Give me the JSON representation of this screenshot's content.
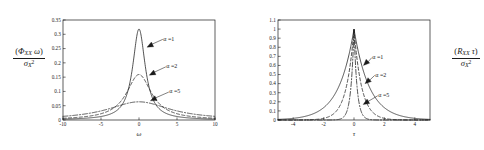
{
  "figure": {
    "background_color": "#ffffff",
    "line_color": "#1a1a1a"
  },
  "panels": [
    {
      "id": "left",
      "y_axis_label": {
        "numerator_prefix": "(",
        "numerator_symbol": "Φ",
        "numerator_subscript": "XX",
        "numerator_variable": "ω",
        "numerator_suffix": ")",
        "denominator_symbol": "σ",
        "denominator_subscript": "X",
        "denominator_superscript": "2"
      },
      "x_axis_label": "ω",
      "annotations": [
        {
          "label": "α =1",
          "tip_x": 1.05,
          "tip_y": 0.255
        },
        {
          "label": "α =2",
          "tip_x": 1.35,
          "tip_y": 0.157
        },
        {
          "label": "α =5",
          "tip_x": 1.5,
          "tip_y": 0.067
        }
      ]
    },
    {
      "id": "right",
      "y_axis_label": {
        "numerator_prefix": "(",
        "numerator_symbol": "R",
        "numerator_subscript": "XX",
        "numerator_variable": "τ",
        "numerator_suffix": ")",
        "denominator_symbol": "σ",
        "denominator_subscript": "X",
        "denominator_superscript": "2"
      },
      "x_axis_label": "τ",
      "annotations": [
        {
          "label": "α =1",
          "tip_x": 0.62,
          "tip_y": 0.6
        },
        {
          "label": "α =2",
          "tip_x": 0.72,
          "tip_y": 0.4
        },
        {
          "label": "α =5",
          "tip_x": 0.6,
          "tip_y": 0.17
        }
      ]
    }
  ],
  "chart_data": [
    {
      "type": "line",
      "id": "power-spectral-density",
      "title": "",
      "xlabel": "ω",
      "ylabel": "(Φ_XX ω) / σ_X^2",
      "xlim": [
        -10,
        10
      ],
      "ylim": [
        0,
        0.35
      ],
      "xticks": [
        -10,
        -5,
        0,
        5,
        10
      ],
      "xtick_labels": [
        "-10",
        "-5",
        "0",
        "5",
        "10"
      ],
      "yticks": [
        0,
        0.05,
        0.1,
        0.15,
        0.2,
        0.25,
        0.3,
        0.35
      ],
      "ytick_labels": [
        "0",
        "0.05",
        "0.1",
        "0.15",
        "0.2",
        "0.25",
        "0.3",
        "0.35"
      ],
      "grid": false,
      "legend": "annotations-on-curves",
      "formula": "(1/pi) * alpha / (alpha^2 + omega^2)",
      "series": [
        {
          "name": "α =1",
          "alpha": 1,
          "style": "solid",
          "peak_value": 0.3183,
          "x": [
            -10,
            -8,
            -6,
            -5,
            -4,
            -3,
            -2.5,
            -2,
            -1.5,
            -1,
            -0.75,
            -0.5,
            -0.25,
            0,
            0.25,
            0.5,
            0.75,
            1,
            1.5,
            2,
            2.5,
            3,
            4,
            5,
            6,
            8,
            10
          ],
          "values": [
            0.00315,
            0.0049,
            0.0086,
            0.01224,
            0.01872,
            0.03183,
            0.0439,
            0.06366,
            0.09793,
            0.15915,
            0.2037,
            0.25465,
            0.2992,
            0.31831,
            0.2992,
            0.25465,
            0.2037,
            0.15915,
            0.09793,
            0.06366,
            0.0439,
            0.03183,
            0.01872,
            0.01224,
            0.0086,
            0.0049,
            0.00315
          ]
        },
        {
          "name": "α =2",
          "alpha": 2,
          "style": "dashed",
          "peak_value": 0.1592,
          "x": [
            -10,
            -8,
            -6,
            -5,
            -4,
            -3,
            -2.5,
            -2,
            -1.5,
            -1,
            -0.75,
            -0.5,
            -0.25,
            0,
            0.25,
            0.5,
            0.75,
            1,
            1.5,
            2,
            2.5,
            3,
            4,
            5,
            6,
            8,
            10
          ],
          "values": [
            0.00612,
            0.00937,
            0.01592,
            0.02195,
            0.03183,
            0.04897,
            0.06236,
            0.07958,
            0.10186,
            0.12732,
            0.1398,
            0.15074,
            0.15767,
            0.15915,
            0.15767,
            0.15074,
            0.1398,
            0.12732,
            0.10186,
            0.07958,
            0.06236,
            0.04897,
            0.03183,
            0.02195,
            0.01592,
            0.00937,
            0.00612
          ]
        },
        {
          "name": "α =5",
          "alpha": 5,
          "style": "dashdot",
          "peak_value": 0.0637,
          "x": [
            -10,
            -8,
            -6,
            -5,
            -4,
            -3,
            -2.5,
            -2,
            -1.5,
            -1,
            -0.75,
            -0.5,
            -0.25,
            0,
            0.25,
            0.5,
            0.75,
            1,
            1.5,
            2,
            2.5,
            3,
            4,
            5,
            6,
            8,
            10
          ],
          "values": [
            0.01273,
            0.01786,
            0.02604,
            0.03183,
            0.03882,
            0.04684,
            0.05093,
            0.05492,
            0.05859,
            0.06123,
            0.06222,
            0.06293,
            0.06336,
            0.06366,
            0.06336,
            0.06293,
            0.06222,
            0.06123,
            0.05859,
            0.05492,
            0.05093,
            0.04684,
            0.03882,
            0.03183,
            0.02604,
            0.01786,
            0.01273
          ]
        }
      ]
    },
    {
      "type": "line",
      "id": "autocorrelation-function",
      "title": "",
      "xlabel": "τ",
      "ylabel": "(R_XX τ) / σ_X^2",
      "xlim": [
        -5,
        5
      ],
      "ylim": [
        0,
        1.1
      ],
      "xticks": [
        -4,
        -2,
        0,
        2,
        4
      ],
      "xtick_labels": [
        "-4",
        "-2",
        "0",
        "2",
        "4"
      ],
      "yticks": [
        0,
        0.1,
        0.2,
        0.3,
        0.4,
        0.5,
        0.6,
        0.7,
        0.8,
        0.9,
        1,
        1.1
      ],
      "ytick_labels": [
        "0",
        "0.1",
        "0.2",
        "0.3",
        "0.4",
        "0.5",
        "0.6",
        "0.7",
        "0.8",
        "0.9",
        "1",
        "1.1"
      ],
      "grid": false,
      "legend": "annotations-on-curves",
      "formula": "exp(-alpha * abs(tau))",
      "series": [
        {
          "name": "α =1",
          "alpha": 1,
          "style": "solid",
          "peak_value": 1.0,
          "x": [
            -5,
            -4,
            -3,
            -2.5,
            -2,
            -1.5,
            -1,
            -0.75,
            -0.5,
            -0.25,
            0,
            0.25,
            0.5,
            0.75,
            1,
            1.5,
            2,
            2.5,
            3,
            4,
            5
          ],
          "values": [
            0.0067,
            0.0183,
            0.0498,
            0.0821,
            0.1353,
            0.2231,
            0.3679,
            0.4724,
            0.6065,
            0.7788,
            1.0,
            0.7788,
            0.6065,
            0.4724,
            0.3679,
            0.2231,
            0.1353,
            0.0821,
            0.0498,
            0.0183,
            0.0067
          ]
        },
        {
          "name": "α =2",
          "alpha": 2,
          "style": "dashed",
          "peak_value": 1.0,
          "x": [
            -5,
            -4,
            -3,
            -2.5,
            -2,
            -1.5,
            -1,
            -0.75,
            -0.5,
            -0.25,
            0,
            0.25,
            0.5,
            0.75,
            1,
            1.5,
            2,
            2.5,
            3,
            4,
            5
          ],
          "values": [
            5e-05,
            0.00034,
            0.0025,
            0.0067,
            0.0183,
            0.0498,
            0.1353,
            0.2231,
            0.3679,
            0.6065,
            1.0,
            0.6065,
            0.3679,
            0.2231,
            0.1353,
            0.0498,
            0.0183,
            0.0067,
            0.0025,
            0.00034,
            5e-05
          ]
        },
        {
          "name": "α =5",
          "alpha": 5,
          "style": "dashdot",
          "peak_value": 1.0,
          "x": [
            -5,
            -4,
            -3,
            -2.5,
            -2,
            -1.5,
            -1,
            -0.75,
            -0.5,
            -0.25,
            0,
            0.25,
            0.5,
            0.75,
            1,
            1.5,
            2,
            2.5,
            3,
            4,
            5
          ],
          "values": [
            0.0,
            0.0,
            0.0,
            0.0,
            5e-05,
            0.00055,
            0.0067,
            0.0235,
            0.0821,
            0.2865,
            1.0,
            0.2865,
            0.0821,
            0.0235,
            0.0067,
            0.00055,
            5e-05,
            0.0,
            0.0,
            0.0,
            0.0
          ]
        }
      ]
    }
  ]
}
